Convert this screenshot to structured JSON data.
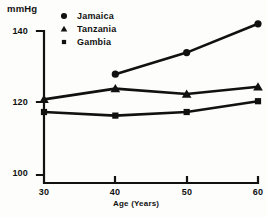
{
  "chart_data": {
    "type": "line",
    "title": "",
    "subtitle": "",
    "xlabel": "Age (Years)",
    "ylabel": "mmHg",
    "ylabel_position": "top-left",
    "x": [
      30,
      40,
      50,
      60
    ],
    "xtick_labels": [
      "30",
      "40",
      "50",
      "60"
    ],
    "ytick_labels": [
      "100",
      "120",
      "140"
    ],
    "yticks": [
      100,
      120,
      140
    ],
    "xlim": [
      30,
      60
    ],
    "ylim": [
      100,
      144
    ],
    "grid": false,
    "legend_position": "top-left-inside",
    "series": [
      {
        "name": "Jamaica",
        "marker": "circle",
        "x": [
          40,
          50,
          60
        ],
        "values": [
          128,
          134,
          142
        ]
      },
      {
        "name": "Tanzania",
        "marker": "triangle",
        "x": [
          30,
          40,
          50,
          60
        ],
        "values": [
          121,
          124,
          122.5,
          124.5
        ]
      },
      {
        "name": "Gambia",
        "marker": "square",
        "x": [
          30,
          40,
          50,
          60
        ],
        "values": [
          117.5,
          116.5,
          117.5,
          120.5
        ]
      }
    ],
    "colors": {
      "line": "#111111",
      "marker": "#111111",
      "axis": "#111111",
      "background": "#fdfdfb"
    }
  },
  "labels": {
    "unit": "mmHg",
    "x_axis_title": "Age (Years)"
  },
  "legend": {
    "items": [
      {
        "label": "Jamaica",
        "marker": "circle-marker-icon"
      },
      {
        "label": "Tanzania",
        "marker": "triangle-marker-icon"
      },
      {
        "label": "Gambia",
        "marker": "square-marker-icon"
      }
    ]
  },
  "axes": {
    "y": {
      "ticks": [
        "140",
        "120",
        "100"
      ]
    },
    "x": {
      "ticks": [
        "30",
        "40",
        "50",
        "60"
      ]
    }
  }
}
